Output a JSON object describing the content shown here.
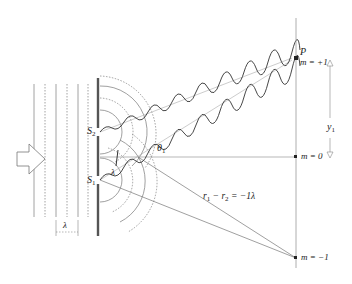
{
  "figure": {
    "colors": {
      "line": "#8a8a8a",
      "dark": "#333333",
      "barrier": "#555555",
      "background": "#ffffff"
    }
  },
  "labels": {
    "point_p": "P",
    "m_plus_1": "m = +1",
    "m_zero": "m = 0",
    "m_minus_1": "m = −1",
    "y1_main": "y",
    "y1_sub": "1",
    "theta_main": "θ",
    "theta_sub": "1",
    "s2_main": "S",
    "s2_sub": "2",
    "s1_main": "S",
    "s1_sub": "1",
    "lambda_slit": "λ",
    "lambda_wave": "λ",
    "path_diff_r1": "r",
    "path_diff_r1_sub": "1",
    "path_diff_minus": " − ",
    "path_diff_r2": "r",
    "path_diff_r2_sub": "2",
    "path_diff_rhs": " = −1λ"
  },
  "icons": {
    "incident_arrow": "hollow-right-arrow",
    "y1_up_arrow": "hollow-up-triangle",
    "y1_down_arrow": "hollow-down-triangle"
  }
}
